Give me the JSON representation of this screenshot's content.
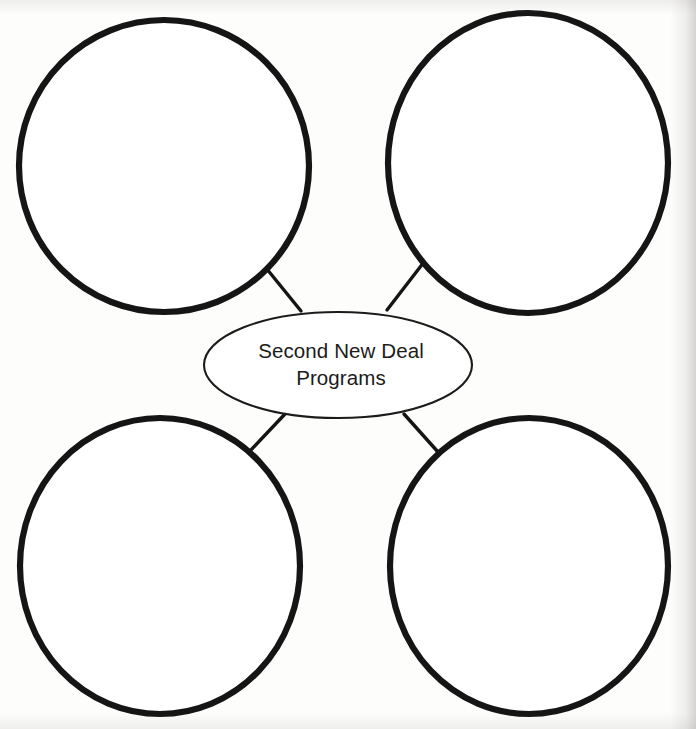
{
  "worksheet": {
    "type": "graphic-organizer",
    "layout": "central-oval-with-four-satellite-circles",
    "background_color": "#fdfdfc",
    "ink_color": "#151515"
  },
  "center": {
    "shape": "ellipse",
    "line_1": "Second New Deal",
    "line_2": "Programs",
    "full_text": "Second New Deal Programs",
    "stroke_color": "#1b1b1b",
    "stroke_width_px": 2,
    "cx": 338,
    "cy": 365,
    "rx": 134,
    "ry": 53
  },
  "nodes": [
    {
      "id": "node-top-left",
      "position": "top-left",
      "label": "",
      "placeholder": "",
      "stroke_color": "#151515",
      "stroke_width_px": 6,
      "cx": 164,
      "cy": 166,
      "rx": 146,
      "ry": 146
    },
    {
      "id": "node-top-right",
      "position": "top-right",
      "label": "",
      "placeholder": "",
      "stroke_color": "#151515",
      "stroke_width_px": 6,
      "cx": 528,
      "cy": 163,
      "rx": 140,
      "ry": 150
    },
    {
      "id": "node-bottom-left",
      "position": "bottom-left",
      "label": "",
      "placeholder": "",
      "stroke_color": "#151515",
      "stroke_width_px": 6,
      "cx": 160,
      "cy": 566,
      "rx": 140,
      "ry": 148
    },
    {
      "id": "node-bottom-right",
      "position": "bottom-right",
      "label": "",
      "placeholder": "",
      "stroke_color": "#151515",
      "stroke_width_px": 6,
      "cx": 529,
      "cy": 566,
      "rx": 139,
      "ry": 148
    }
  ],
  "connectors": [
    {
      "id": "connector-top-left",
      "from": "node-top-left",
      "to": "center",
      "x1": 262,
      "y1": 263,
      "x2": 301,
      "y2": 311,
      "stroke_color": "#151515",
      "stroke_width_px": 3
    },
    {
      "id": "connector-top-right",
      "from": "node-top-right",
      "to": "center",
      "x1": 424,
      "y1": 262,
      "x2": 387,
      "y2": 310,
      "stroke_color": "#151515",
      "stroke_width_px": 3
    },
    {
      "id": "connector-bottom-left",
      "from": "node-bottom-left",
      "to": "center",
      "x1": 249,
      "y1": 452,
      "x2": 285,
      "y2": 414,
      "stroke_color": "#151515",
      "stroke_width_px": 3
    },
    {
      "id": "connector-bottom-right",
      "from": "node-bottom-right",
      "to": "center",
      "x1": 438,
      "y1": 452,
      "x2": 404,
      "y2": 414,
      "stroke_color": "#151515",
      "stroke_width_px": 3
    }
  ]
}
